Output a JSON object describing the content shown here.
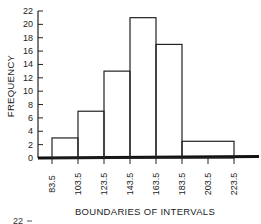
{
  "chart_data": {
    "type": "bar",
    "subtype": "histogram",
    "title": "",
    "xlabel": "BOUNDARIES OF INTERVALS",
    "ylabel": "FREQUENCY",
    "x_ticks": [
      "83.5",
      "103.5",
      "123.5",
      "143.5",
      "163.5",
      "183.5",
      "203.5",
      "223.5"
    ],
    "y_ticks": [
      "0",
      "2",
      "4",
      "6",
      "8",
      "10",
      "12",
      "14",
      "16",
      "18",
      "20",
      "22"
    ],
    "ylim": [
      0,
      22
    ],
    "xlim": [
      83.5,
      223.5
    ],
    "bins": [
      {
        "from": 83.5,
        "to": 103.5,
        "value": 3
      },
      {
        "from": 103.5,
        "to": 123.5,
        "value": 7
      },
      {
        "from": 123.5,
        "to": 143.5,
        "value": 13
      },
      {
        "from": 143.5,
        "to": 163.5,
        "value": 21
      },
      {
        "from": 163.5,
        "to": 183.5,
        "value": 17
      },
      {
        "from": 183.5,
        "to": 223.5,
        "value": 2.5
      }
    ],
    "grid": false,
    "legend": "none"
  },
  "fragment": {
    "next_figure_tick": "22"
  }
}
